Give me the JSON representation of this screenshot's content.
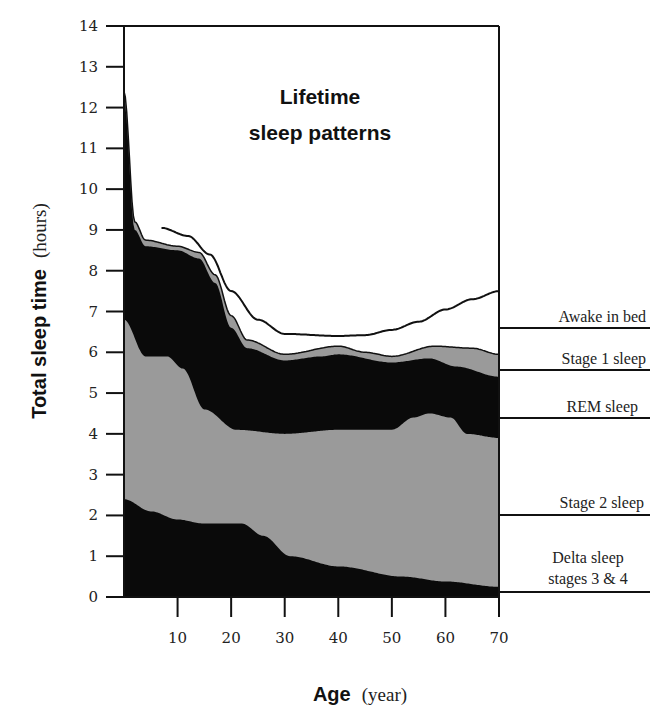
{
  "chart_data": {
    "type": "area",
    "title": "Lifetime sleep patterns",
    "xlabel": "Age",
    "xlabel_unit": "(year)",
    "ylabel": "Total sleep time",
    "ylabel_unit": "(hours)",
    "xlim": [
      0,
      70
    ],
    "ylim": [
      0,
      14
    ],
    "x_ticks": [
      10,
      20,
      30,
      40,
      50,
      60,
      70
    ],
    "y_ticks": [
      0,
      1,
      2,
      3,
      4,
      5,
      6,
      7,
      8,
      9,
      10,
      11,
      12,
      13,
      14
    ],
    "grid": false,
    "stacked": true,
    "note": "values are cumulative upper boundaries (hours) of each stacked layer",
    "series": [
      {
        "name": "Delta sleep stages 3 & 4",
        "fill": "#0a0a0a",
        "x": [
          0,
          5,
          10,
          15,
          22,
          26,
          31,
          40,
          52,
          60,
          70
        ],
        "upper": [
          2.4,
          2.1,
          1.9,
          1.8,
          1.8,
          1.5,
          1.0,
          0.75,
          0.5,
          0.38,
          0.25
        ]
      },
      {
        "name": "Stage 2 sleep",
        "fill": "#9a9a9a",
        "x": [
          0,
          4,
          8,
          11,
          15,
          21,
          30,
          40,
          50,
          54,
          57,
          61,
          64,
          70
        ],
        "upper": [
          6.8,
          5.9,
          5.9,
          5.6,
          4.6,
          4.1,
          4.0,
          4.1,
          4.1,
          4.4,
          4.5,
          4.4,
          4.0,
          3.9
        ]
      },
      {
        "name": "REM sleep",
        "fill": "#0a0a0a",
        "x": [
          0,
          2,
          4,
          10,
          14,
          17,
          20,
          23,
          30,
          37,
          40,
          50,
          57,
          62,
          70
        ],
        "upper": [
          12.2,
          9.0,
          8.6,
          8.5,
          8.3,
          7.7,
          6.6,
          6.1,
          5.8,
          5.9,
          5.95,
          5.75,
          5.85,
          5.65,
          5.4
        ]
      },
      {
        "name": "Stage 1 sleep",
        "fill": "#9a9a9a",
        "x": [
          0,
          2,
          4,
          10,
          14,
          17,
          20,
          23,
          30,
          40,
          45,
          50,
          58,
          65,
          70
        ],
        "upper": [
          12.4,
          9.2,
          8.75,
          8.6,
          8.45,
          7.9,
          6.9,
          6.3,
          5.95,
          6.15,
          6.0,
          5.9,
          6.15,
          6.1,
          5.95
        ]
      },
      {
        "name": "Awake in bed",
        "fill": "none",
        "x": [
          7,
          12,
          16,
          20,
          25,
          30,
          40,
          45,
          50,
          55,
          60,
          65,
          70
        ],
        "upper": [
          9.05,
          8.85,
          8.4,
          7.5,
          6.8,
          6.45,
          6.4,
          6.42,
          6.55,
          6.75,
          7.05,
          7.3,
          7.5
        ]
      }
    ],
    "legend": {
      "position": "right",
      "entries": [
        "Awake in bed",
        "Stage 1 sleep",
        "REM sleep",
        "Stage 2 sleep",
        "Delta sleep stages 3 & 4"
      ]
    }
  },
  "labels": {
    "title_line1": "Lifetime",
    "title_line2": "sleep patterns",
    "x_bold": "Age",
    "x_unit": "(year)",
    "y_bold": "Total sleep time",
    "y_unit": "(hours)",
    "awake": "Awake in bed",
    "stage1": "Stage 1 sleep",
    "rem": "REM sleep",
    "stage2": "Stage 2 sleep",
    "delta_line1": "Delta sleep",
    "delta_line2": "stages 3 & 4"
  }
}
